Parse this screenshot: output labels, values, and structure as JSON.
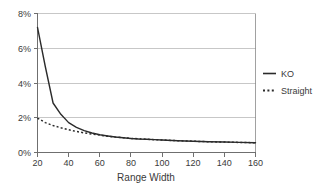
{
  "chart_data": {
    "type": "line",
    "title": "",
    "xlabel": "Range Width",
    "ylabel": "",
    "xlim": [
      20,
      160
    ],
    "ylim": [
      0,
      8
    ],
    "grid": true,
    "legend_position": "right",
    "x_ticks": [
      "20",
      "40",
      "60",
      "80",
      "100",
      "120",
      "140",
      "160"
    ],
    "x_tick_values": [
      20,
      40,
      60,
      80,
      100,
      120,
      140,
      160
    ],
    "y_ticks": [
      "0%",
      "2%",
      "4%",
      "6%",
      "8%"
    ],
    "y_tick_values": [
      0,
      2,
      4,
      6,
      8
    ],
    "x": [
      20,
      25,
      30,
      35,
      40,
      45,
      50,
      55,
      60,
      65,
      70,
      75,
      80,
      85,
      90,
      95,
      100,
      110,
      120,
      130,
      140,
      150,
      160
    ],
    "series": [
      {
        "name": "KO",
        "style": "solid",
        "color": "#2b2b2b",
        "values": [
          7.2,
          4.95,
          2.85,
          2.2,
          1.72,
          1.45,
          1.26,
          1.12,
          1.02,
          0.95,
          0.89,
          0.85,
          0.81,
          0.78,
          0.76,
          0.74,
          0.72,
          0.68,
          0.65,
          0.62,
          0.6,
          0.58,
          0.56
        ]
      },
      {
        "name": "Straight",
        "style": "dotted",
        "color": "#2b2b2b",
        "values": [
          1.98,
          1.72,
          1.55,
          1.42,
          1.31,
          1.21,
          1.13,
          1.06,
          1.0,
          0.94,
          0.89,
          0.85,
          0.81,
          0.79,
          0.76,
          0.74,
          0.72,
          0.68,
          0.65,
          0.62,
          0.6,
          0.58,
          0.56
        ]
      }
    ]
  },
  "legend": {
    "items": [
      {
        "label": "KO",
        "style": "solid"
      },
      {
        "label": "Straight",
        "style": "dotted"
      }
    ]
  },
  "axes": {
    "x_title": "Range Width"
  }
}
